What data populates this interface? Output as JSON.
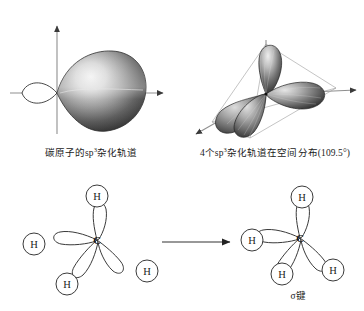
{
  "figure": {
    "background_color": "#ffffff",
    "ink_color": "#1a1a1a",
    "axis_color": "#8c8c8c"
  },
  "panels": {
    "single_orbital": {
      "caption_prefix": "碳原子的sp",
      "caption_exponent": "3",
      "caption_suffix": "杂化轨道",
      "axis_vertical_name": "vertical-axis",
      "axis_horizontal_name": "horizontal-axis",
      "large_lobe_label": "large-lobe",
      "small_lobe_label": "small-lobe"
    },
    "tetrahedral": {
      "caption_count": "4个sp",
      "caption_exponent": "3",
      "caption_suffix": "杂化轨道在空间分布(109.5°)",
      "lobe_count": 4,
      "bond_angle": "109.5°"
    },
    "reactants": {
      "center_atom": "C",
      "hydrogens": [
        "H",
        "H",
        "H",
        "H"
      ],
      "orbital_lobes": 4
    },
    "products": {
      "center_atom": "C",
      "hydrogens": [
        "H",
        "H",
        "H",
        "H"
      ],
      "orbital_lobes": 4,
      "bond_label": "σ键"
    },
    "reaction_arrow": {
      "name": "reaction-arrow",
      "direction": "right"
    }
  }
}
